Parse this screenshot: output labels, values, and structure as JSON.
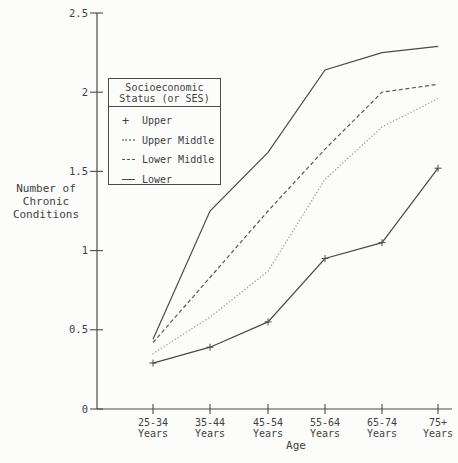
{
  "chart_data": {
    "type": "line",
    "xlabel": "Age",
    "ylabel": "Number of\nChronic\nConditions",
    "ylim": [
      0,
      2.5
    ],
    "yticks": [
      0,
      0.5,
      1,
      1.5,
      2,
      2.5
    ],
    "ytick_labels": [
      "0",
      "0.5",
      "1",
      "1.5",
      "2",
      "2.5"
    ],
    "categories": [
      {
        "label": "25-34",
        "sublabel": "Years"
      },
      {
        "label": "35-44",
        "sublabel": "Years"
      },
      {
        "label": "45-54",
        "sublabel": "Years"
      },
      {
        "label": "55-64",
        "sublabel": "Years"
      },
      {
        "label": "65-74",
        "sublabel": "Years"
      },
      {
        "label": "75+",
        "sublabel": "Years"
      }
    ],
    "legend": {
      "title_line1": "Socioeconomic",
      "title_line2": "Status (or SES)",
      "position": "upper-left"
    },
    "series": [
      {
        "name": "Upper",
        "style": "solid",
        "marker": "plus",
        "color": "#4a4a4a",
        "values": [
          0.29,
          0.39,
          0.55,
          0.95,
          1.05,
          1.52
        ]
      },
      {
        "name": "Upper Middle",
        "style": "dotted",
        "marker": "none",
        "color": "#9b9b9b",
        "values": [
          0.35,
          0.58,
          0.87,
          1.45,
          1.78,
          1.96
        ]
      },
      {
        "name": "Lower Middle",
        "style": "dashed",
        "marker": "none",
        "color": "#585858",
        "values": [
          0.42,
          0.83,
          1.25,
          1.64,
          2.0,
          2.05
        ]
      },
      {
        "name": "Lower",
        "style": "solid",
        "marker": "none",
        "color": "#4a4a4a",
        "values": [
          0.44,
          1.25,
          1.62,
          2.14,
          2.25,
          2.29
        ]
      }
    ],
    "grid": false
  },
  "colors": {
    "background": "#fcfcfb",
    "axis": "#4a4a4a",
    "text": "#3f3f3f"
  }
}
